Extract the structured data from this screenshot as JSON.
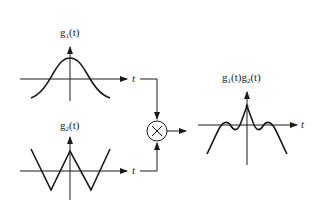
{
  "diagram": {
    "signals": {
      "g1": {
        "label_base": "g",
        "label_sub": "1",
        "label_arg": "(t)",
        "shape": "bell-shaped pulse"
      },
      "g2": {
        "label_base": "g",
        "label_sub": "2",
        "label_arg": "(t)",
        "shape": "triangular zigzag"
      },
      "product": {
        "label_g1_base": "g",
        "label_g1_sub": "1",
        "label_g1_arg": "(t)",
        "label_g2_base": "g",
        "label_g2_sub": "2",
        "label_g2_arg": "(t)",
        "shape": "peaked with side ripples"
      }
    },
    "axis_labels": {
      "t_top": "t",
      "t_bottom": "t",
      "t_output": "t"
    },
    "operator": {
      "symbol": "×",
      "name": "multiplier"
    },
    "colors": {
      "stroke": "#1a1a1a",
      "background": "#ffffff"
    }
  }
}
